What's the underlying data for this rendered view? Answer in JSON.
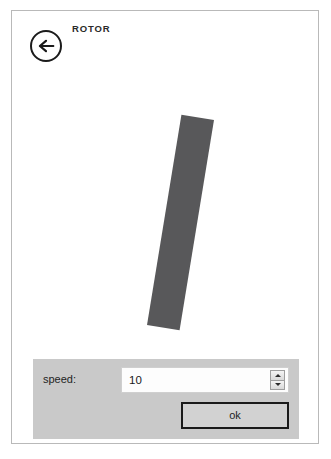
{
  "window": {
    "app_title": "ROTOR"
  },
  "header": {
    "back_icon": "arrow-left-icon",
    "title": "ROTOR"
  },
  "stage": {
    "rotor_shape": "rotor-bar",
    "rotor_color": "#58585a",
    "rotor_rotation_deg": "9.3"
  },
  "controls": {
    "speed_label": "speed:",
    "speed_value": "10",
    "speed_placeholder": "10",
    "spinner_up_icon": "triangle-up-icon",
    "spinner_down_icon": "triangle-down-icon",
    "ok_label": "ok"
  },
  "colors": {
    "panel_background": "#c9c9c9",
    "rotor": "#58585a",
    "canvas": "#ffffff",
    "outline": "#1a1a1a"
  }
}
